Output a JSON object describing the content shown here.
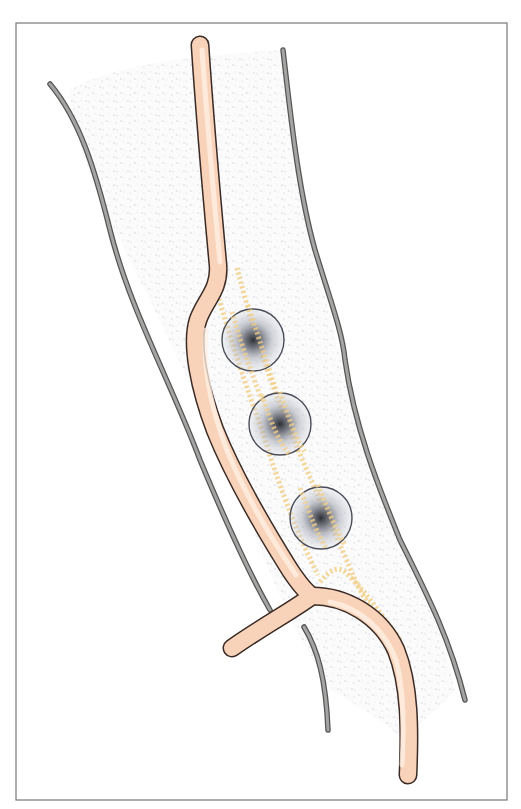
{
  "figure": {
    "type": "anatomical-illustration",
    "colors": {
      "background": "#ffffff",
      "frame": "#777777",
      "vessel_fill": "#f9d5bd",
      "vessel_outline": "#3b2b25",
      "wall_line": "#a4a4a2",
      "track": "#f2cf86",
      "lesion_core": "#2e2f36",
      "lesion_ring": "#4a4d57",
      "stipple": "#e6e9ee"
    },
    "elements": {
      "frame": "frame-border",
      "left_wall": "left-boundary-line",
      "right_wall": "right-boundary-line",
      "lower_wall": "lower-boundary-line",
      "vessel": "main-vessel",
      "branch": "side-branch",
      "tracks": [
        "dotted-track-left",
        "dotted-track-right",
        "dotted-track-branch"
      ],
      "lesions": [
        {
          "id": "lesion-1",
          "cx": 253,
          "cy": 340,
          "r": 31
        },
        {
          "id": "lesion-2",
          "cx": 280,
          "cy": 424,
          "r": 31
        },
        {
          "id": "lesion-3",
          "cx": 321,
          "cy": 518,
          "r": 31
        }
      ]
    }
  }
}
